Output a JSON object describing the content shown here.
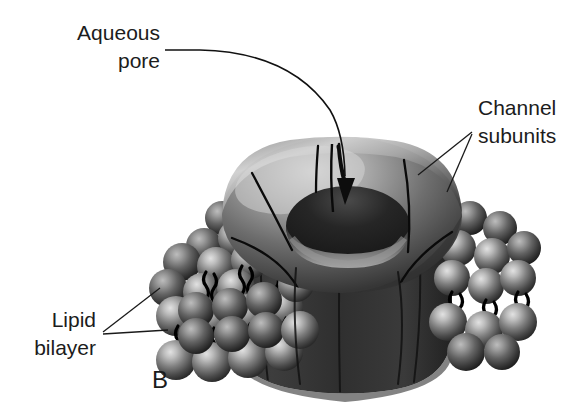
{
  "figure": {
    "panel_label": "B",
    "background_color": "#ffffff",
    "ink_color": "#1c1c1c"
  },
  "labels": [
    {
      "id": "aqueous-pore",
      "line1": "Aqueous",
      "line2": "pore",
      "anchor": "end",
      "x": 160,
      "y1": 40,
      "y2": 68,
      "leader_style": "curved-arrow"
    },
    {
      "id": "channel-subunits",
      "line1": "Channel",
      "line2": "subunits",
      "anchor": "start",
      "x": 478,
      "y1": 115,
      "y2": 143,
      "leader_style": "two-line-fan"
    },
    {
      "id": "lipid-bilayer",
      "line1": "Lipid",
      "line2": "bilayer",
      "anchor": "end",
      "x": 96,
      "y1": 327,
      "y2": 355,
      "leader_style": "two-line-fan"
    }
  ],
  "panel": {
    "label": "B",
    "x": 160,
    "y": 388
  },
  "structures": {
    "channel": {
      "name": "channel-protein",
      "description": "torus ring on cylindrical barrel",
      "subunit_count": 5,
      "colors": {
        "highlight": "#d6d6d6",
        "midtone": "#8a8a8a",
        "shadow": "#3a3a3a",
        "barrel_dark": "#2a2a2a",
        "pore_dark": "#1a1a1a"
      }
    },
    "bilayer": {
      "name": "lipid-bilayer",
      "leaflets": 2,
      "head_color_light": "#cfcfcf",
      "head_color_mid": "#7c7c7c",
      "head_color_dark": "#323232",
      "tail_color": "#000000"
    },
    "pore_arrow": {
      "name": "aqueous-pore-arrow",
      "color": "#0d0d0d",
      "direction": "down-into-pore"
    }
  }
}
